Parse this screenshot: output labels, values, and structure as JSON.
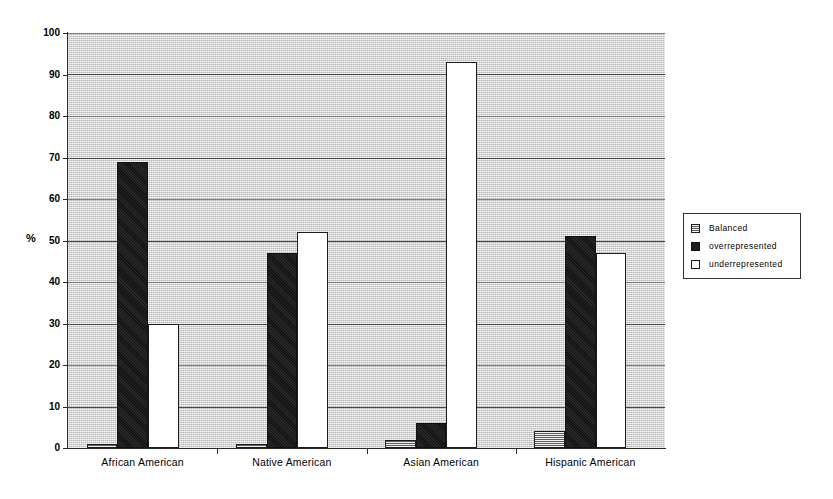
{
  "chart_data": {
    "type": "bar",
    "title": "",
    "subtitle": "",
    "xlabel": "",
    "ylabel": "%",
    "ylim": [
      0,
      100
    ],
    "yticks": [
      0,
      10,
      20,
      30,
      40,
      50,
      60,
      70,
      80,
      90,
      100
    ],
    "grid": true,
    "legend_position": "right",
    "categories": [
      "African American",
      "Native American",
      "Asian American",
      "Hispanic American"
    ],
    "series": [
      {
        "name": "Balanced",
        "values": [
          1,
          1,
          2,
          4
        ]
      },
      {
        "name": "overrepresented",
        "values": [
          69,
          47,
          6,
          51
        ]
      },
      {
        "name": "underrepresented",
        "values": [
          30,
          52,
          93,
          47
        ]
      }
    ]
  },
  "axes": {
    "y_label": "%",
    "y_ticks": [
      {
        "value": 100,
        "label": "100"
      },
      {
        "value": 90,
        "label": "90"
      },
      {
        "value": 80,
        "label": "80"
      },
      {
        "value": 70,
        "label": "70"
      },
      {
        "value": 60,
        "label": "60"
      },
      {
        "value": 50,
        "label": "50"
      },
      {
        "value": 40,
        "label": "40"
      },
      {
        "value": 30,
        "label": "30"
      },
      {
        "value": 20,
        "label": "20"
      },
      {
        "value": 10,
        "label": "10"
      },
      {
        "value": 0,
        "label": "0"
      }
    ]
  },
  "legend": {
    "items": [
      {
        "label": "Balanced",
        "swatch": "balanced"
      },
      {
        "label": "overrepresented",
        "swatch": "over"
      },
      {
        "label": "underrepresented",
        "swatch": "under"
      }
    ]
  },
  "colors": {
    "plot_background": "#d2d2d2",
    "gridline": "#4a4a4a",
    "axis": "#2a2a2a",
    "balanced": "#b4b4b4",
    "overrepresented": "#1c1c1c",
    "underrepresented": "#ffffff"
  }
}
